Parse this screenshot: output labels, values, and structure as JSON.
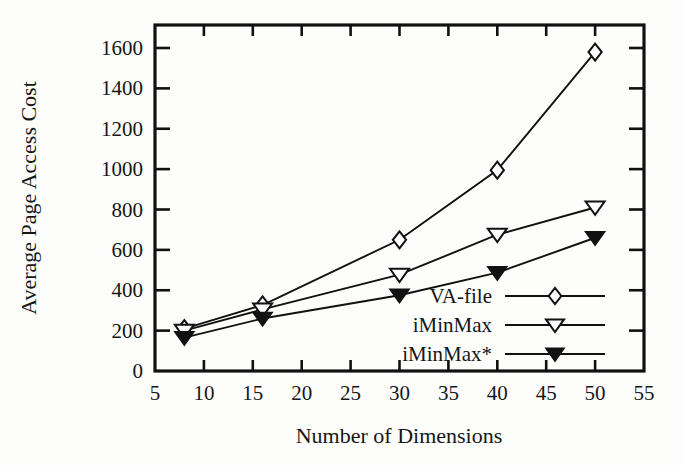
{
  "chart_data": {
    "type": "line",
    "title": "",
    "xlabel": "Number of Dimensions",
    "ylabel": "Average Page Access Cost",
    "x": [
      8,
      16,
      30,
      40,
      50
    ],
    "xlim": [
      5,
      55
    ],
    "ylim": [
      0,
      1700
    ],
    "xticks": [
      5,
      10,
      15,
      20,
      25,
      30,
      35,
      40,
      45,
      50,
      55
    ],
    "yticks": [
      0,
      200,
      400,
      600,
      800,
      1000,
      1200,
      1400,
      1600
    ],
    "grid": false,
    "legend_position": "lower-right-inside",
    "series": [
      {
        "name": "VA-file",
        "marker": "open-diamond",
        "values": [
          210,
          327,
          650,
          995,
          1580
        ]
      },
      {
        "name": "iMinMax",
        "marker": "open-triangle-down",
        "values": [
          200,
          305,
          477,
          675,
          810
        ]
      },
      {
        "name": "iMinMax*",
        "marker": "filled-triangle-down",
        "values": [
          165,
          260,
          375,
          487,
          660
        ]
      }
    ]
  },
  "axes": {
    "x_tick_labels": [
      "5",
      "10",
      "15",
      "20",
      "25",
      "30",
      "35",
      "40",
      "45",
      "50",
      "55"
    ],
    "y_tick_labels": [
      "0",
      "200",
      "400",
      "600",
      "800",
      "1000",
      "1200",
      "1400",
      "1600"
    ],
    "x_axis_title": "Number of Dimensions",
    "y_axis_title": "Average Page Access Cost"
  },
  "legend": {
    "entries": [
      {
        "label": "VA-file",
        "marker": "open-diamond"
      },
      {
        "label": "iMinMax",
        "marker": "open-triangle-down"
      },
      {
        "label": "iMinMax*",
        "marker": "filled-triangle-down"
      }
    ]
  },
  "colors": {
    "ink": "#111111",
    "paper": "#fdfdfc",
    "marker_fill_open": "#ffffff",
    "marker_fill_solid": "#111111"
  }
}
